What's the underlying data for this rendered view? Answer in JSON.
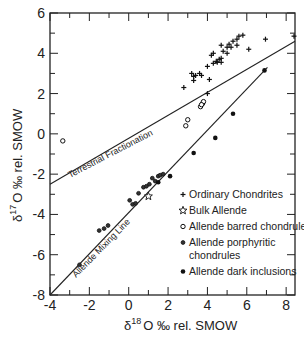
{
  "chart_data": {
    "type": "scatter",
    "title": "",
    "xlabel": "δ18O ‰ rel. SMOW",
    "ylabel": "δ17O ‰ rel. SMOW",
    "xlabel_parts": {
      "delta": "δ",
      "sup": "18",
      "rest": "O ‰ rel. SMOW"
    },
    "ylabel_parts": {
      "delta": "δ",
      "sup": "17",
      "rest": "O ‰ rel. SMOW"
    },
    "xlim": [
      -4,
      8.45
    ],
    "ylim": [
      -8,
      6
    ],
    "xticks": [
      -4,
      -2,
      0,
      2,
      4,
      6,
      8
    ],
    "xtick_labels": [
      "-4",
      "-2",
      "0",
      "2",
      "4",
      "6",
      "8"
    ],
    "yticks": [
      -8,
      -6,
      -4,
      -2,
      0,
      2,
      4,
      6
    ],
    "ytick_labels": [
      "-8",
      "-6",
      "-4",
      "-2",
      "0",
      "2",
      "4",
      "6"
    ],
    "grid": false,
    "legend_position": "bottom-right",
    "reference_lines": [
      {
        "name": "Terrestrial Fractionation",
        "x": [
          -4,
          8.45
        ],
        "y": [
          -2.5,
          4.6
        ]
      },
      {
        "name": "Allende Mixing Line",
        "x": [
          -4,
          7.05
        ],
        "y": [
          -8,
          3.3
        ]
      }
    ],
    "series": [
      {
        "name": "Ordinary Chondrites",
        "marker": "plus",
        "points": [
          [
            2.8,
            2.3
          ],
          [
            3.2,
            3.0
          ],
          [
            3.3,
            2.85
          ],
          [
            3.3,
            2.65
          ],
          [
            3.4,
            2.9
          ],
          [
            3.6,
            3.0
          ],
          [
            3.7,
            2.9
          ],
          [
            4.0,
            3.35
          ],
          [
            4.1,
            2.7
          ],
          [
            4.3,
            3.5
          ],
          [
            4.2,
            3.9
          ],
          [
            4.3,
            4.0
          ],
          [
            4.45,
            3.6
          ],
          [
            4.5,
            3.55
          ],
          [
            4.6,
            3.7
          ],
          [
            4.7,
            3.75
          ],
          [
            4.8,
            4.1
          ],
          [
            4.7,
            4.4
          ],
          [
            5.0,
            4.3
          ],
          [
            5.1,
            4.45
          ],
          [
            5.2,
            4.3
          ],
          [
            5.3,
            4.6
          ],
          [
            5.5,
            4.4
          ],
          [
            5.5,
            4.7
          ],
          [
            5.6,
            4.85
          ],
          [
            5.8,
            4.9
          ],
          [
            6.1,
            4.2
          ],
          [
            6.95,
            4.7
          ],
          [
            8.4,
            4.85
          ],
          [
            4.0,
            2.0
          ],
          [
            4.7,
            3.55
          ],
          [
            5.0,
            4.0
          ]
        ]
      },
      {
        "name": "Bulk Allende",
        "marker": "star",
        "points": [
          [
            1.0,
            -3.1
          ]
        ]
      },
      {
        "name": "Allende barred chondrules",
        "marker": "circle-open",
        "points": [
          [
            2.9,
            0.4
          ],
          [
            3.0,
            0.7
          ],
          [
            3.65,
            1.35
          ],
          [
            3.75,
            1.5
          ],
          [
            3.8,
            1.6
          ],
          [
            3.7,
            1.45
          ],
          [
            -3.35,
            -0.35
          ]
        ]
      },
      {
        "name": "Allende porphyritic chondrules",
        "marker": "circle-half",
        "points": [
          [
            -2.5,
            -6.5
          ],
          [
            -1.5,
            -4.8
          ],
          [
            -1.25,
            -4.7
          ],
          [
            -1.05,
            -4.55
          ],
          [
            0.05,
            -3.3
          ],
          [
            0.2,
            -3.5
          ],
          [
            0.35,
            -3.45
          ],
          [
            0.5,
            -2.95
          ],
          [
            0.75,
            -2.65
          ],
          [
            1.05,
            -2.5
          ],
          [
            1.2,
            -2.2
          ],
          [
            1.5,
            -2.1
          ],
          [
            1.6,
            -2.05
          ],
          [
            1.75,
            -2.0
          ],
          [
            0.9,
            -2.6
          ],
          [
            1.35,
            -2.35
          ]
        ]
      },
      {
        "name": "Allende dark inclusions",
        "marker": "circle-filled",
        "points": [
          [
            1.5,
            -2.4
          ],
          [
            2.1,
            -2.1
          ],
          [
            3.3,
            -0.95
          ],
          [
            4.4,
            -0.2
          ],
          [
            5.3,
            1.0
          ],
          [
            6.9,
            3.15
          ]
        ]
      }
    ]
  }
}
